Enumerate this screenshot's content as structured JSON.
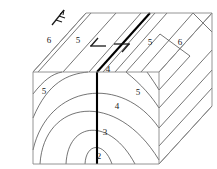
{
  "diagram": {
    "background_color": "#ffffff",
    "line_color": "#3a3a3a",
    "edge_color": "#888888",
    "fault_color": "#000000"
  },
  "units": {
    "top_face": [
      {
        "label": "6",
        "x": 49,
        "y": 41
      },
      {
        "label": "5",
        "x": 78,
        "y": 41
      },
      {
        "label": "4",
        "x": 108,
        "y": 72
      },
      {
        "label": "5",
        "x": 150,
        "y": 43
      },
      {
        "label": "6",
        "x": 180,
        "y": 43
      }
    ],
    "front_face": [
      {
        "label": "5",
        "x": 44,
        "y": 92
      },
      {
        "label": "4",
        "x": 117,
        "y": 107
      },
      {
        "label": "3",
        "x": 104,
        "y": 133
      },
      {
        "label": "2",
        "x": 98,
        "y": 157
      },
      {
        "label": "5",
        "x": 138,
        "y": 93
      }
    ]
  },
  "symbols": {
    "strike_dip": {
      "name": "strike-and-dip-symbol",
      "x": 58,
      "y": 17
    },
    "fault_arrows": {
      "name": "strike-slip-fault-arrows",
      "left_x": 100,
      "right_x": 120,
      "y": 45
    }
  }
}
